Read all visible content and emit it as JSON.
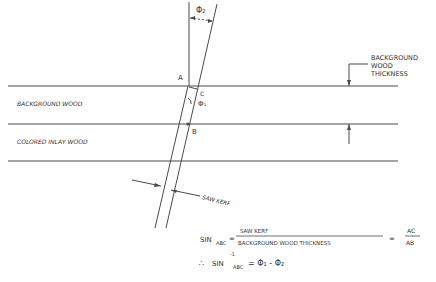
{
  "diagram": {
    "labels": {
      "phi2_top": "Φ₂",
      "background_wood_thickness": [
        "BACKGROUND",
        "WOOD",
        "THICKNESS"
      ],
      "background_wood": "BACKGROUND WOOD",
      "colored_inlay_wood": "COLORED INLAY WOOD",
      "point_a": "A",
      "point_b": "B",
      "point_c": "C",
      "phi1": "Φ₁",
      "saw_kerf": "SAW KERF"
    },
    "equation": {
      "sin": "SIN",
      "sub_abc": "ABC",
      "eq": "=",
      "numerator": "SAW KERF",
      "denominator": "BACKGROUND WOOD THICKNESS",
      "frac_num": "AC",
      "frac_den": "AB",
      "therefore": "∴",
      "sin2": "SIN",
      "sup": "-1",
      "sub_abc2": "ABC",
      "result": "= Φ₁ - Φ₂"
    },
    "line_color": "#4a4a4a"
  }
}
